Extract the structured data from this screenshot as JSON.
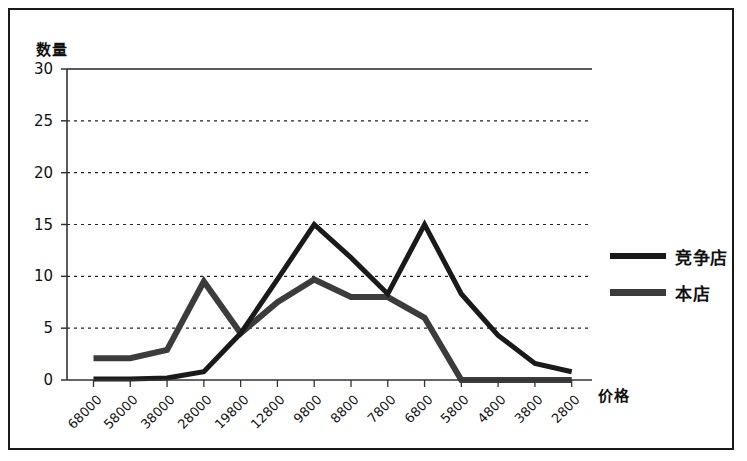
{
  "chart_data": {
    "type": "line",
    "title": "",
    "xlabel": "价格",
    "ylabel": "数量",
    "categories": [
      "68000",
      "58000",
      "38000",
      "28000",
      "19800",
      "12800",
      "9800",
      "8800",
      "7800",
      "6800",
      "5800",
      "4800",
      "3800",
      "2800"
    ],
    "series": [
      {
        "name": "竞争店",
        "color": "#1a1a1a",
        "values": [
          0.1,
          0.1,
          0.2,
          0.8,
          4.5,
          9.7,
          15.0,
          11.8,
          8.3,
          15.0,
          8.3,
          4.3,
          1.6,
          0.8
        ]
      },
      {
        "name": "本店",
        "color": "#3c3c3c",
        "values": [
          2.1,
          2.1,
          2.9,
          9.5,
          4.5,
          7.5,
          9.7,
          8.0,
          8.0,
          6.0,
          0.0,
          0.0,
          0.0,
          0.0
        ]
      }
    ],
    "ylim": [
      0,
      30
    ],
    "y_ticks": [
      0,
      5,
      10,
      15,
      20,
      25,
      30
    ],
    "grid": "horizontal-dashed",
    "legend_position": "right"
  },
  "legend": {
    "items": [
      {
        "label": "竞争店",
        "marker": "thin-black-line"
      },
      {
        "label": "本店",
        "marker": "thick-gray-line"
      }
    ]
  },
  "axes": {
    "y_title": "数量",
    "x_title": "价格",
    "y_tick_labels": [
      "30",
      "25",
      "20",
      "15",
      "10",
      "5",
      "0"
    ],
    "x_tick_labels": [
      "68000",
      "58000",
      "38000",
      "28000",
      "19800",
      "12800",
      "9800",
      "8800",
      "7800",
      "6800",
      "5800",
      "4800",
      "3800",
      "2800"
    ]
  }
}
